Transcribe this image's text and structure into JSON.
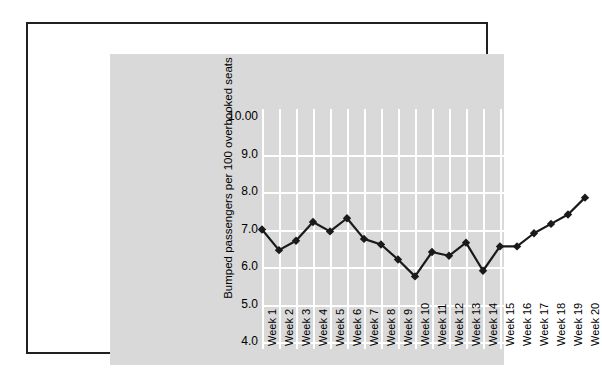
{
  "figure": {
    "background_color": "#ffffff",
    "panel_color": "#d9d9d9",
    "border_color": "#231f20",
    "gridline_color": "#ffffff",
    "series_color": "#1a1a1a"
  },
  "chart_data": {
    "type": "line",
    "title": "",
    "xlabel": "",
    "ylabel": "Bumped passengers per 100 overbooked seats",
    "ylim": [
      4.0,
      10.0
    ],
    "ytick_labels": [
      "10.00",
      "9.0",
      "8.0",
      "7.0",
      "6.0",
      "5.0",
      "4.0"
    ],
    "ytick_values": [
      10.0,
      9.0,
      8.0,
      7.0,
      6.0,
      5.0,
      4.0
    ],
    "grid": true,
    "legend": "none",
    "marker": "diamond",
    "categories": [
      "Week 1",
      "Week 2",
      "Week 3",
      "Week 4",
      "Week 5",
      "Week 6",
      "Week 7",
      "Week 8",
      "Week 9",
      "Week 10",
      "Week 11",
      "Week 12",
      "Week 13",
      "Week 14",
      "Week 15",
      "Week 16",
      "Week 17",
      "Week 18",
      "Week 19",
      "Week 20"
    ],
    "values": [
      7.0,
      6.45,
      6.7,
      7.2,
      6.95,
      7.3,
      6.75,
      6.6,
      6.2,
      5.75,
      6.4,
      6.3,
      6.65,
      5.9,
      6.55,
      6.55,
      6.9,
      7.15,
      7.4,
      7.85
    ]
  }
}
